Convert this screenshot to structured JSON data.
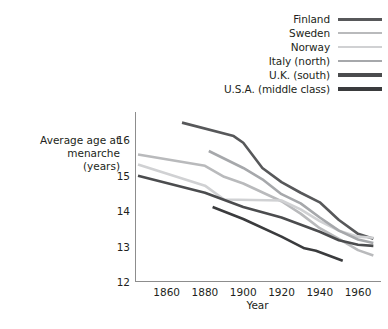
{
  "chart_data": {
    "type": "line",
    "title": "",
    "xlabel": "Year",
    "ylabel": "Average age at menarche (years)",
    "ylabel_lines": [
      "Average age at",
      "menarche",
      "(years)"
    ],
    "xlim": [
      1845,
      1972
    ],
    "ylim": [
      12,
      16.8
    ],
    "xticks": [
      1860,
      1880,
      1900,
      1920,
      1940,
      1960
    ],
    "yticks": [
      12,
      13,
      14,
      15,
      16
    ],
    "grid": false,
    "legend_position": "top-right",
    "series": [
      {
        "name": "Finland",
        "color": "#57585a",
        "width": 2.6,
        "points": [
          [
            1868,
            16.5
          ],
          [
            1895,
            16.12
          ],
          [
            1900,
            15.93
          ],
          [
            1910,
            15.22
          ],
          [
            1920,
            14.82
          ],
          [
            1930,
            14.52
          ],
          [
            1940,
            14.25
          ],
          [
            1950,
            13.75
          ],
          [
            1960,
            13.36
          ],
          [
            1968,
            13.22
          ]
        ]
      },
      {
        "name": "Sweden",
        "color": "#b9babc",
        "width": 2.6,
        "points": [
          [
            1845,
            15.6
          ],
          [
            1880,
            15.28
          ],
          [
            1890,
            14.97
          ],
          [
            1900,
            14.78
          ],
          [
            1920,
            14.28
          ],
          [
            1930,
            13.93
          ],
          [
            1940,
            13.52
          ],
          [
            1950,
            13.22
          ],
          [
            1960,
            12.9
          ],
          [
            1968,
            12.75
          ]
        ]
      },
      {
        "name": "Norway",
        "color": "#d0d1d3",
        "width": 2.6,
        "points": [
          [
            1845,
            15.32
          ],
          [
            1880,
            14.72
          ],
          [
            1890,
            14.33
          ],
          [
            1920,
            14.3
          ],
          [
            1930,
            14.05
          ],
          [
            1940,
            13.72
          ],
          [
            1950,
            13.45
          ],
          [
            1960,
            13.28
          ],
          [
            1968,
            13.25
          ]
        ]
      },
      {
        "name": "Italy (north)",
        "color": "#a6a8ab",
        "width": 2.6,
        "points": [
          [
            1882,
            15.7
          ],
          [
            1900,
            15.22
          ],
          [
            1910,
            14.9
          ],
          [
            1920,
            14.48
          ],
          [
            1930,
            14.22
          ],
          [
            1940,
            13.82
          ],
          [
            1950,
            13.45
          ],
          [
            1960,
            13.2
          ],
          [
            1968,
            13.1
          ]
        ]
      },
      {
        "name": "U.K. (south)",
        "color": "#4b4c4e",
        "width": 2.6,
        "points": [
          [
            1845,
            15.0
          ],
          [
            1880,
            14.52
          ],
          [
            1900,
            14.12
          ],
          [
            1920,
            13.82
          ],
          [
            1940,
            13.42
          ],
          [
            1950,
            13.18
          ],
          [
            1960,
            13.05
          ],
          [
            1968,
            13.02
          ]
        ]
      },
      {
        "name": "U.S.A. (middle class)",
        "color": "#3a3b3d",
        "width": 2.6,
        "points": [
          [
            1884,
            14.12
          ],
          [
            1900,
            13.78
          ],
          [
            1920,
            13.28
          ],
          [
            1932,
            12.95
          ],
          [
            1938,
            12.88
          ],
          [
            1952,
            12.6
          ]
        ]
      }
    ]
  },
  "legend": {
    "items": [
      {
        "label": "Finland",
        "color": "#57585a",
        "width": 3.0
      },
      {
        "label": "Sweden",
        "color": "#b9babc",
        "width": 2.4
      },
      {
        "label": "Norway",
        "color": "#d0d1d3",
        "width": 2.4
      },
      {
        "label": "Italy (north)",
        "color": "#a6a8ab",
        "width": 2.4
      },
      {
        "label": "U.K. (south)",
        "color": "#4b4c4e",
        "width": 3.2
      },
      {
        "label": "U.S.A. (middle class)",
        "color": "#3a3b3d",
        "width": 3.2
      }
    ]
  },
  "axes": {
    "x_title": "Year",
    "y_title_line1": "Average age at",
    "y_title_line2": "menarche",
    "y_title_line3": "(years)",
    "x_tick_labels": [
      "1860",
      "1880",
      "1900",
      "1920",
      "1940",
      "1960"
    ],
    "y_tick_labels": [
      "16",
      "15",
      "14",
      "13",
      "12"
    ],
    "axis_color": "#8d8d8d"
  }
}
